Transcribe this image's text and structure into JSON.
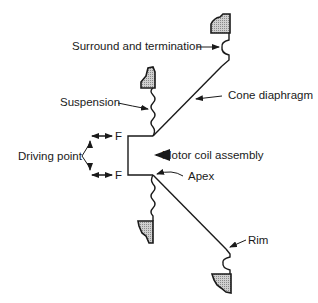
{
  "diagram": {
    "type": "loudspeaker-cone-cross-section",
    "colors": {
      "line": "#1a1a1a",
      "hatch_fill": "#b8b8b8",
      "background": "#ffffff"
    },
    "labels": {
      "surround": "Surround and termination",
      "suspension": "Suspension",
      "cone": "Cone diaphragm",
      "driving_point": "Driving point",
      "force_top": "F",
      "force_bottom": "F",
      "motor_coil": "Motor coil assembly",
      "apex": "Apex",
      "rim": "Rim"
    }
  }
}
